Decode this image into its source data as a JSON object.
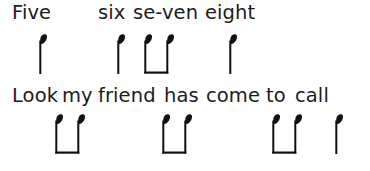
{
  "page": {
    "background_color": "#ffffff",
    "ink_color": "#1c1c1c"
  },
  "lines": [
    {
      "id": "line-1",
      "lyrics": [
        {
          "text": "Five",
          "x": 12
        },
        {
          "text": "six",
          "x": 98
        },
        {
          "text": "se-ven",
          "x": 133
        },
        {
          "text": "eight",
          "x": 205
        }
      ],
      "notes": [
        {
          "type": "quarter",
          "x": 34,
          "label": "quarter-note"
        },
        {
          "type": "quarter",
          "x": 112,
          "label": "quarter-note"
        },
        {
          "type": "beamed-pair",
          "x": 139,
          "label": "beamed-eighth-pair",
          "span": 34
        },
        {
          "type": "quarter",
          "x": 224,
          "label": "quarter-note"
        }
      ]
    },
    {
      "id": "line-2",
      "lyrics": [
        {
          "text": "Look",
          "x": 12
        },
        {
          "text": "my",
          "x": 62
        },
        {
          "text": "friend",
          "x": 98
        },
        {
          "text": "has",
          "x": 164
        },
        {
          "text": "come",
          "x": 206
        },
        {
          "text": "to",
          "x": 266
        },
        {
          "text": "call",
          "x": 295
        }
      ],
      "notes": [
        {
          "type": "beamed-pair",
          "x": 50,
          "label": "beamed-eighth-pair",
          "span": 34
        },
        {
          "type": "beamed-pair",
          "x": 157,
          "label": "beamed-eighth-pair",
          "span": 34
        },
        {
          "type": "beamed-pair",
          "x": 267,
          "label": "beamed-eighth-pair",
          "span": 34
        },
        {
          "type": "quarter",
          "x": 330,
          "label": "quarter-note"
        }
      ]
    }
  ]
}
